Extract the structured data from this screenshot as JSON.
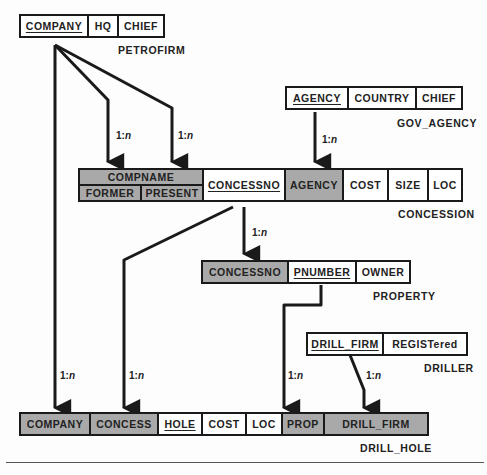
{
  "colors": {
    "foreign_key_fill": "#a9a9a9",
    "line": "#1a1a1a",
    "background": "#fdfdfd"
  },
  "relations": {
    "petrofirm": {
      "name": "PETROFIRM",
      "fields": [
        {
          "label": "COMPANY",
          "key": true,
          "fk": false
        },
        {
          "label": "HQ",
          "key": false,
          "fk": false
        },
        {
          "label": "CHIEF",
          "key": false,
          "fk": false
        }
      ]
    },
    "gov_agency": {
      "name": "GOV_AGENCY",
      "fields": [
        {
          "label": "AGENCY",
          "key": true,
          "fk": false
        },
        {
          "label": "COUNTRY",
          "key": false,
          "fk": false
        },
        {
          "label": "CHIEF",
          "key": false,
          "fk": false
        }
      ]
    },
    "concession": {
      "name": "CONCESSION",
      "compname_group": {
        "label": "COMPNAME",
        "subfields": [
          "FORMER",
          "PRESENT"
        ]
      },
      "fields": [
        {
          "label": "CONCESSNO",
          "key": true,
          "fk": false
        },
        {
          "label": "AGENCY",
          "key": false,
          "fk": true
        },
        {
          "label": "COST",
          "key": false,
          "fk": false
        },
        {
          "label": "SIZE",
          "key": false,
          "fk": false
        },
        {
          "label": "LOC",
          "key": false,
          "fk": false
        }
      ]
    },
    "property": {
      "name": "PROPERTY",
      "fields": [
        {
          "label": "CONCESSNO",
          "key": false,
          "fk": true
        },
        {
          "label": "PNUMBER",
          "key": true,
          "fk": false
        },
        {
          "label": "OWNER",
          "key": false,
          "fk": false
        }
      ]
    },
    "driller": {
      "name": "DRILLER",
      "fields": [
        {
          "label": "DRILL_FIRM",
          "key": true,
          "fk": false
        },
        {
          "label": "REGISTered",
          "key": false,
          "fk": false
        }
      ]
    },
    "drill_hole": {
      "name": "DRILL_HOLE",
      "fields": [
        {
          "label": "COMPANY",
          "key": false,
          "fk": true
        },
        {
          "label": "CONCESS",
          "key": false,
          "fk": true
        },
        {
          "label": "HOLE",
          "key": true,
          "fk": false
        },
        {
          "label": "COST",
          "key": false,
          "fk": false
        },
        {
          "label": "LOC",
          "key": false,
          "fk": false
        },
        {
          "label": "PROP",
          "key": false,
          "fk": true
        },
        {
          "label": "DRILL_FIRM",
          "key": false,
          "fk": true
        }
      ]
    }
  },
  "cardinality": {
    "one": "1:",
    "many": "n"
  }
}
